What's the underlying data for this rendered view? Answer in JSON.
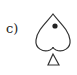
{
  "label": "c)",
  "figure": {
    "shape": "spade-outline",
    "has_dot": true,
    "stroke_color": "#333333",
    "dot_color": "#222222",
    "fill_color": "#ffffff"
  }
}
